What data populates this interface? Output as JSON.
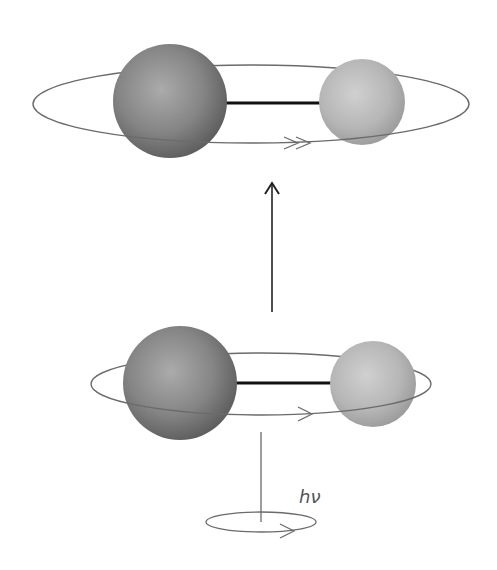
{
  "diagram": {
    "colors": {
      "background": "#ffffff",
      "large_atom_light": "#a8a8a8",
      "large_atom_dark": "#5e5e5e",
      "small_atom_light": "#cfcfcf",
      "small_atom_dark": "#9a9a9a",
      "bond": "#111111",
      "orbit": "#6b6b6b",
      "arrow": "#222222"
    },
    "excited_state": {
      "name": "upper rotating molecule",
      "orbit": {
        "cx": 251,
        "cy": 104,
        "rx": 218,
        "ry": 39
      },
      "large_atom": {
        "cx": 170,
        "cy": 101,
        "r": 57
      },
      "small_atom": {
        "cx": 362,
        "cy": 102,
        "r": 43
      },
      "rotation_arrow": "double-chevron"
    },
    "ground_state": {
      "name": "lower rotating molecule",
      "orbit": {
        "cx": 261,
        "cy": 384,
        "rx": 170,
        "ry": 31
      },
      "large_atom": {
        "cx": 180,
        "cy": 383,
        "r": 57
      },
      "small_atom": {
        "cx": 373,
        "cy": 384,
        "r": 43
      },
      "rotation_arrow": "single-chevron"
    },
    "transition_arrow": {
      "x": 272,
      "y1": 312,
      "y2": 183,
      "direction": "up"
    },
    "photon": {
      "label": "hν",
      "axis": {
        "x": 261,
        "y1": 432,
        "y2": 522
      },
      "orbit": {
        "cx": 261,
        "cy": 522,
        "rx": 55,
        "ry": 10
      }
    }
  }
}
